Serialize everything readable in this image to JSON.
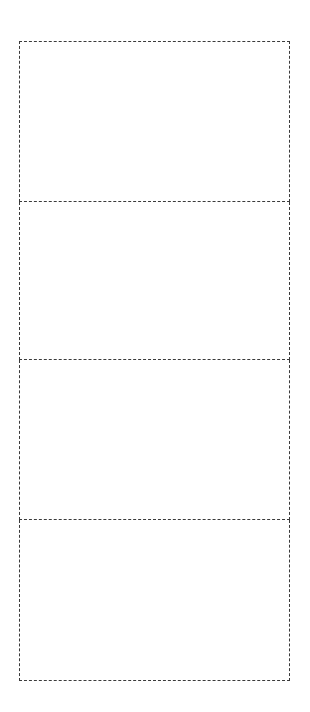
{
  "template": {
    "type": "dashed-panel-strip",
    "panel_count": 4,
    "line_color": "#3a3a3a",
    "background": "#ffffff",
    "panels": [
      {
        "index": 1,
        "label": ""
      },
      {
        "index": 2,
        "label": ""
      },
      {
        "index": 3,
        "label": ""
      },
      {
        "index": 4,
        "label": ""
      }
    ]
  }
}
